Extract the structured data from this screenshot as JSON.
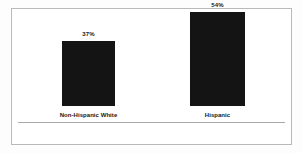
{
  "chart_data": {
    "type": "bar",
    "title": "",
    "subtitle": "",
    "xlabel": "",
    "ylabel": "",
    "ylim": [
      0,
      60
    ],
    "grid": false,
    "legend": null,
    "categories": [
      "Non-Hispanic White",
      "Hispanic"
    ],
    "values": [
      37,
      54
    ],
    "value_labels": [
      "37%",
      "54%"
    ],
    "bar_color": "#141414",
    "axis_color": "#a8a8a8",
    "frame_color": "#b9b9b9",
    "background_color": "#ffffff"
  }
}
